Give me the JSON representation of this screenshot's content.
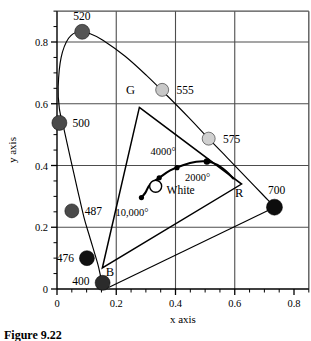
{
  "figure": {
    "kind": "cie-chromaticity-diagram",
    "caption": "Figure 9.22",
    "background": "#ffffff",
    "ink": "#000000",
    "grid_color": "#4d4d4d"
  },
  "axes": {
    "x": {
      "label": "x axis",
      "min": 0,
      "max": 0.85,
      "ticks_major": [
        0,
        0.2,
        0.4,
        0.6,
        0.8
      ],
      "tick_labels": [
        "0",
        "0.2",
        "0.4",
        "0.6",
        "0.8"
      ],
      "minor_step": 0.05,
      "gridlines": [
        0.2,
        0.4,
        0.6
      ]
    },
    "y": {
      "label": "y axis",
      "min": 0,
      "max": 0.9,
      "ticks_major": [
        0,
        0.2,
        0.4,
        0.6,
        0.8
      ],
      "tick_labels": [
        "0",
        "0.2",
        "0.4",
        "0.6",
        "0.8"
      ],
      "minor_step": 0.05,
      "gridlines": [
        0.2,
        0.4,
        0.6,
        0.8
      ]
    },
    "grid": true
  },
  "chart_data": {
    "type": "scatter",
    "title": "",
    "xlabel": "x axis",
    "ylabel": "y axis",
    "xlim": [
      0,
      0.85
    ],
    "ylim": [
      0,
      0.9
    ],
    "grid": true,
    "legend": "none",
    "spectral_locus": {
      "name": "Spectral locus (horseshoe)",
      "closed": true,
      "points": [
        [
          0.174,
          0.005
        ],
        [
          0.151,
          0.03
        ],
        [
          0.138,
          0.08
        ],
        [
          0.11,
          0.17
        ],
        [
          0.091,
          0.232
        ],
        [
          0.069,
          0.323
        ],
        [
          0.045,
          0.425
        ],
        [
          0.023,
          0.52
        ],
        [
          0.008,
          0.584
        ],
        [
          0.004,
          0.655
        ],
        [
          0.014,
          0.75
        ],
        [
          0.039,
          0.812
        ],
        [
          0.074,
          0.834
        ],
        [
          0.114,
          0.826
        ],
        [
          0.155,
          0.806
        ],
        [
          0.23,
          0.754
        ],
        [
          0.302,
          0.692
        ],
        [
          0.373,
          0.625
        ],
        [
          0.445,
          0.555
        ],
        [
          0.512,
          0.487
        ],
        [
          0.575,
          0.425
        ],
        [
          0.627,
          0.373
        ],
        [
          0.666,
          0.334
        ],
        [
          0.694,
          0.306
        ],
        [
          0.714,
          0.286
        ],
        [
          0.735,
          0.265
        ]
      ],
      "purple_line": [
        [
          0.735,
          0.265
        ],
        [
          0.174,
          0.005
        ]
      ]
    },
    "wavelength_markers": [
      {
        "label": "520",
        "x": 0.085,
        "y": 0.833,
        "shade": "#555555",
        "label_pos": "above",
        "label_x": 0.084,
        "label_y": 0.885,
        "r": 7.5
      },
      {
        "label": "555",
        "x": 0.355,
        "y": 0.645,
        "shade": "#c8c8c8",
        "label_pos": "right",
        "label_x": 0.403,
        "label_y": 0.645,
        "r": 6.5
      },
      {
        "label": "575",
        "x": 0.512,
        "y": 0.487,
        "shade": "#d0d0d0",
        "label_pos": "right",
        "label_x": 0.56,
        "label_y": 0.487,
        "r": 6.5
      },
      {
        "label": "500",
        "x": 0.008,
        "y": 0.538,
        "shade": "#4a4a4a",
        "label_pos": "right",
        "label_x": 0.052,
        "label_y": 0.538,
        "r": 7.5
      },
      {
        "label": "487",
        "x": 0.05,
        "y": 0.253,
        "shade": "#4a4a4a",
        "label_pos": "right",
        "label_x": 0.094,
        "label_y": 0.253,
        "r": 7.0
      },
      {
        "label": "476",
        "x": 0.101,
        "y": 0.1,
        "shade": "#111111",
        "label_pos": "left",
        "label_x": 0.057,
        "label_y": 0.1,
        "r": 7.5
      },
      {
        "label": "400",
        "x": 0.154,
        "y": 0.02,
        "shade": "#2b2b2b",
        "label_pos": "left",
        "label_x": 0.11,
        "label_y": 0.025,
        "r": 7.5
      },
      {
        "label": "700",
        "x": 0.734,
        "y": 0.265,
        "shade": "#0d0d0d",
        "label_pos": "above-left",
        "label_x": 0.712,
        "label_y": 0.32,
        "r": 8.0
      }
    ],
    "rgb_gamut_triangle": {
      "name": "RGB gamut triangle",
      "vertices": [
        {
          "label": "G",
          "x": 0.278,
          "y": 0.588,
          "label_x": 0.248,
          "label_y": 0.63
        },
        {
          "label": "R",
          "x": 0.623,
          "y": 0.34,
          "label_x": 0.615,
          "label_y": 0.298
        },
        {
          "label": "B",
          "x": 0.153,
          "y": 0.068,
          "label_x": 0.179,
          "label_y": 0.043
        }
      ]
    },
    "blackbody_locus": {
      "name": "Planckian / blackbody locus",
      "points": [
        [
          0.285,
          0.296
        ],
        [
          0.299,
          0.313
        ],
        [
          0.313,
          0.337
        ],
        [
          0.345,
          0.36
        ],
        [
          0.382,
          0.384
        ],
        [
          0.425,
          0.401
        ],
        [
          0.47,
          0.412
        ],
        [
          0.506,
          0.413
        ],
        [
          0.54,
          0.403
        ],
        [
          0.57,
          0.382
        ],
        [
          0.595,
          0.358
        ]
      ],
      "markers": [
        {
          "x": 0.285,
          "y": 0.296,
          "r": 2.6,
          "label": "10,000°",
          "label_x": 0.253,
          "label_y": 0.236
        },
        {
          "x": 0.345,
          "y": 0.36,
          "r": 2.6,
          "label": "",
          "label_x": 0,
          "label_y": 0
        },
        {
          "x": 0.405,
          "y": 0.393,
          "r": 2.6,
          "label": "",
          "label_x": 0,
          "label_y": 0
        },
        {
          "x": 0.506,
          "y": 0.413,
          "r": 3.2,
          "label": "",
          "label_x": 0,
          "label_y": 0
        }
      ],
      "annotations": [
        {
          "label": "4000°",
          "x": 0.358,
          "y": 0.433
        },
        {
          "label": "2000°",
          "x": 0.475,
          "y": 0.349
        }
      ]
    },
    "white_point": {
      "label": "White",
      "x": 0.333,
      "y": 0.333,
      "r": 6.0,
      "fill": "#ffffff",
      "label_x": 0.37,
      "label_y": 0.307
    }
  }
}
